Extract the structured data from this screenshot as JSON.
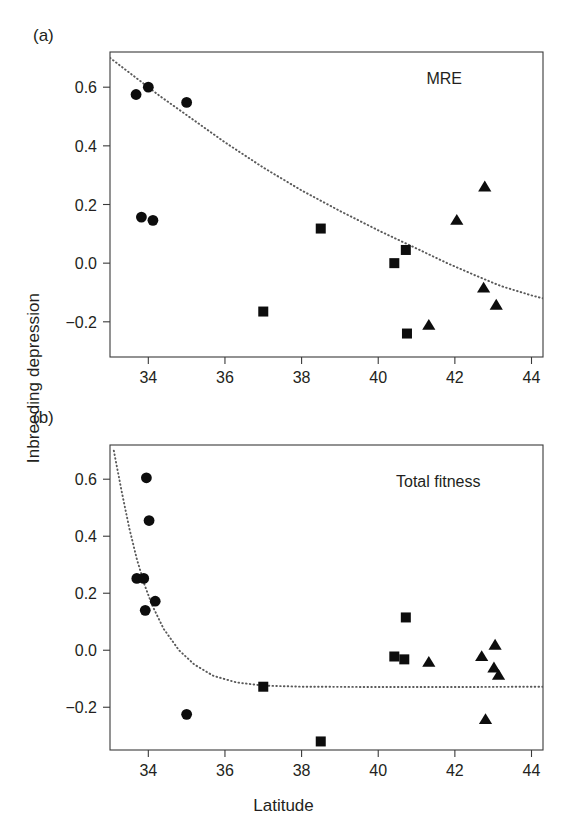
{
  "figure": {
    "axis_title_y": "Inbreeding depression",
    "axis_title_x": "Latitude",
    "panel_a_tag": "(a)",
    "panel_b_tag": "(b)",
    "panel_a_note": "MRE",
    "panel_b_note": "Total fitness",
    "marker_color": "#0d0d0d",
    "curve_color": "#5a5a5a",
    "frame_color": "#3a3a3a"
  },
  "chart_data": [
    {
      "type": "scatter",
      "panel": "(a)",
      "title": "MRE",
      "xlabel": "Latitude",
      "ylabel": "Inbreeding depression",
      "xlim": [
        33.0,
        44.3
      ],
      "ylim": [
        -0.32,
        0.72
      ],
      "xticks": [
        34,
        36,
        38,
        40,
        42,
        44
      ],
      "xticklabels": [
        "34",
        "36",
        "38",
        "40",
        "42",
        "44"
      ],
      "yticks": [
        0.6,
        0.4,
        0.2,
        0.0,
        -0.2
      ],
      "yticklabels": [
        "0.6",
        "0.4",
        "0.2",
        "0.0",
        "-0.2"
      ],
      "grid": false,
      "legend": false,
      "series": [
        {
          "name": "circle-group",
          "marker": "circle",
          "points": [
            {
              "x": 33.68,
              "y": 0.575
            },
            {
              "x": 34.0,
              "y": 0.6
            },
            {
              "x": 35.0,
              "y": 0.548
            },
            {
              "x": 33.82,
              "y": 0.157
            },
            {
              "x": 34.12,
              "y": 0.146
            }
          ]
        },
        {
          "name": "square-group",
          "marker": "square",
          "points": [
            {
              "x": 37.0,
              "y": -0.165
            },
            {
              "x": 38.5,
              "y": 0.118
            },
            {
              "x": 40.42,
              "y": 0.0
            },
            {
              "x": 40.72,
              "y": 0.045
            },
            {
              "x": 40.75,
              "y": -0.24
            }
          ]
        },
        {
          "name": "triangle-group",
          "marker": "triangle",
          "points": [
            {
              "x": 41.32,
              "y": -0.212
            },
            {
              "x": 42.05,
              "y": 0.146
            },
            {
              "x": 42.78,
              "y": 0.26
            },
            {
              "x": 42.75,
              "y": -0.085
            },
            {
              "x": 43.08,
              "y": -0.143
            }
          ]
        }
      ],
      "fit_curve": {
        "style": "dotted",
        "description": "negative exponential decay",
        "points": [
          {
            "x": 33.0,
            "y": 0.7
          },
          {
            "x": 33.6,
            "y": 0.64
          },
          {
            "x": 34.3,
            "y": 0.57
          },
          {
            "x": 35.0,
            "y": 0.505
          },
          {
            "x": 36.0,
            "y": 0.412
          },
          {
            "x": 37.0,
            "y": 0.326
          },
          {
            "x": 38.0,
            "y": 0.248
          },
          {
            "x": 39.0,
            "y": 0.178
          },
          {
            "x": 40.0,
            "y": 0.112
          },
          {
            "x": 41.0,
            "y": 0.05
          },
          {
            "x": 41.8,
            "y": 0.0
          },
          {
            "x": 42.5,
            "y": -0.04
          },
          {
            "x": 43.2,
            "y": -0.078
          },
          {
            "x": 44.0,
            "y": -0.11
          },
          {
            "x": 44.3,
            "y": -0.12
          }
        ]
      }
    },
    {
      "type": "scatter",
      "panel": "(b)",
      "title": "Total fitness",
      "xlabel": "Latitude",
      "ylabel": "Inbreeding depression",
      "xlim": [
        33.0,
        44.3
      ],
      "ylim": [
        -0.35,
        0.72
      ],
      "xticks": [
        34,
        36,
        38,
        40,
        42,
        44
      ],
      "xticklabels": [
        "34",
        "36",
        "38",
        "40",
        "42",
        "44"
      ],
      "yticks": [
        0.6,
        0.4,
        0.2,
        0.0,
        -0.2
      ],
      "yticklabels": [
        "0.6",
        "0.4",
        "0.2",
        "0.0",
        "-0.2"
      ],
      "grid": false,
      "legend": false,
      "series": [
        {
          "name": "circle-group",
          "marker": "circle",
          "points": [
            {
              "x": 33.95,
              "y": 0.605
            },
            {
              "x": 34.02,
              "y": 0.455
            },
            {
              "x": 33.7,
              "y": 0.252
            },
            {
              "x": 33.88,
              "y": 0.252
            },
            {
              "x": 34.18,
              "y": 0.172
            },
            {
              "x": 33.92,
              "y": 0.14
            },
            {
              "x": 35.0,
              "y": -0.225
            }
          ]
        },
        {
          "name": "square-group",
          "marker": "square",
          "points": [
            {
              "x": 37.0,
              "y": -0.128
            },
            {
              "x": 38.5,
              "y": -0.32
            },
            {
              "x": 40.42,
              "y": -0.022
            },
            {
              "x": 40.68,
              "y": -0.032
            },
            {
              "x": 40.72,
              "y": 0.115
            }
          ]
        },
        {
          "name": "triangle-group",
          "marker": "triangle",
          "points": [
            {
              "x": 41.32,
              "y": -0.042
            },
            {
              "x": 42.7,
              "y": -0.022
            },
            {
              "x": 43.05,
              "y": 0.018
            },
            {
              "x": 43.02,
              "y": -0.062
            },
            {
              "x": 43.14,
              "y": -0.088
            },
            {
              "x": 42.8,
              "y": -0.243
            }
          ]
        }
      ],
      "fit_curve": {
        "style": "dotted",
        "description": "steep negative exponential decay to asymptote",
        "points": [
          {
            "x": 33.1,
            "y": 0.7
          },
          {
            "x": 33.3,
            "y": 0.56
          },
          {
            "x": 33.5,
            "y": 0.43
          },
          {
            "x": 33.7,
            "y": 0.32
          },
          {
            "x": 33.9,
            "y": 0.23
          },
          {
            "x": 34.1,
            "y": 0.158
          },
          {
            "x": 34.4,
            "y": 0.075
          },
          {
            "x": 34.8,
            "y": 0.0
          },
          {
            "x": 35.2,
            "y": -0.05
          },
          {
            "x": 35.7,
            "y": -0.09
          },
          {
            "x": 36.3,
            "y": -0.113
          },
          {
            "x": 37.0,
            "y": -0.124
          },
          {
            "x": 38.0,
            "y": -0.128
          },
          {
            "x": 40.0,
            "y": -0.129
          },
          {
            "x": 42.0,
            "y": -0.129
          },
          {
            "x": 44.3,
            "y": -0.128
          }
        ]
      }
    }
  ]
}
